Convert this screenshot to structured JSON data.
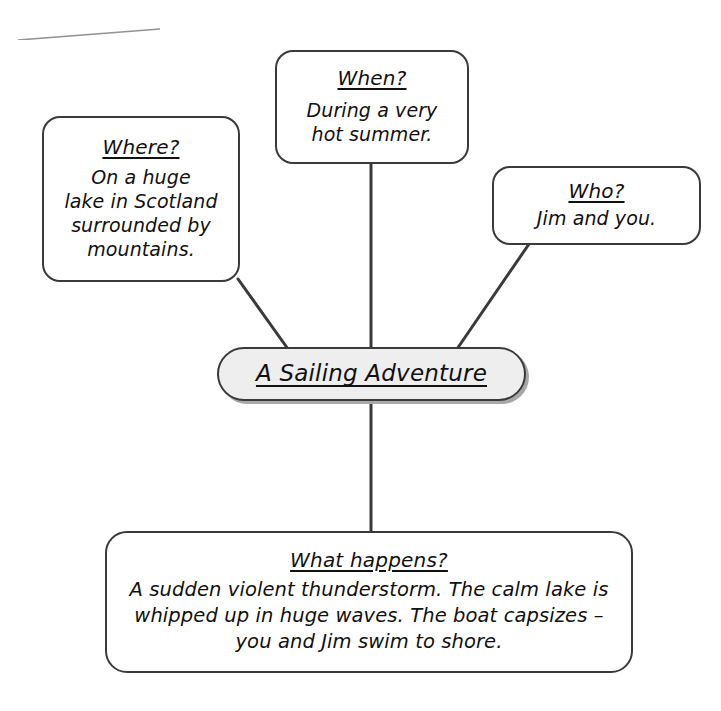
{
  "diagram": {
    "type": "mind-map",
    "center": {
      "name": "central-topic",
      "title": "A Sailing Adventure",
      "underlined": true,
      "fill_color": "#eeeeee",
      "border_color": "#3a3a3a",
      "shadow_color": "#a8a8a8"
    },
    "branches": [
      {
        "name": "where",
        "title": "Where?",
        "body": "On a huge\nlake in Scotland\nsurrounded by\nmountains.",
        "body_lines": [
          "On a huge",
          "lake in Scotland",
          "surrounded by",
          "mountains."
        ]
      },
      {
        "name": "when",
        "title": "When?",
        "body": "During a very\nhot summer.",
        "body_lines": [
          "During a very",
          "hot summer."
        ]
      },
      {
        "name": "who",
        "title": "Who?",
        "body": "Jim and you.",
        "body_lines": [
          "Jim and you."
        ]
      },
      {
        "name": "what-happens",
        "title": "What happens?",
        "body": "A sudden violent thunderstorm. The calm lake is whipped up in huge waves. The boat capsizes – you and Jim swim to shore.",
        "body_lines": [
          "A sudden violent thunderstorm. The calm lake is",
          "whipped up in huge waves. The boat capsizes –",
          "you and Jim swim to shore."
        ]
      }
    ],
    "connectors": [
      {
        "name": "connector-where-to-center",
        "from": "where",
        "to": "center",
        "style": "diagonal"
      },
      {
        "name": "connector-when-to-center",
        "from": "when",
        "to": "center",
        "style": "vertical"
      },
      {
        "name": "connector-who-to-center",
        "from": "who",
        "to": "center",
        "style": "diagonal"
      },
      {
        "name": "connector-center-to-what",
        "from": "center",
        "to": "what-happens",
        "style": "vertical"
      }
    ],
    "line_color": "#3a3a3a",
    "background_color": "#ffffff"
  }
}
